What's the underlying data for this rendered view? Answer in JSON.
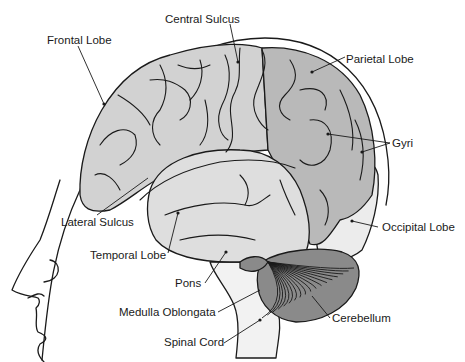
{
  "colors": {
    "frontal": "#d2d2d2",
    "parietal": "#b9b9b9",
    "temporal": "#dedede",
    "occipital": "#ececec",
    "brainstem": "#f2f2f2",
    "cerebellum": "#8a8a8a",
    "line": "#1a1a1a"
  },
  "labels": {
    "central_sulcus": "Central Sulcus",
    "frontal_lobe": "Frontal Lobe",
    "parietal_lobe": "Parietal Lobe",
    "gyri": "Gyri",
    "lateral_sulcus": "Lateral Sulcus",
    "temporal_lobe": "Temporal Lobe",
    "occipital_lobe": "Occipital Lobe",
    "pons": "Pons",
    "medulla_oblongata": "Medulla Oblongata",
    "cerebellum": "Cerebellum",
    "spinal_cord": "Spinal Cord"
  }
}
